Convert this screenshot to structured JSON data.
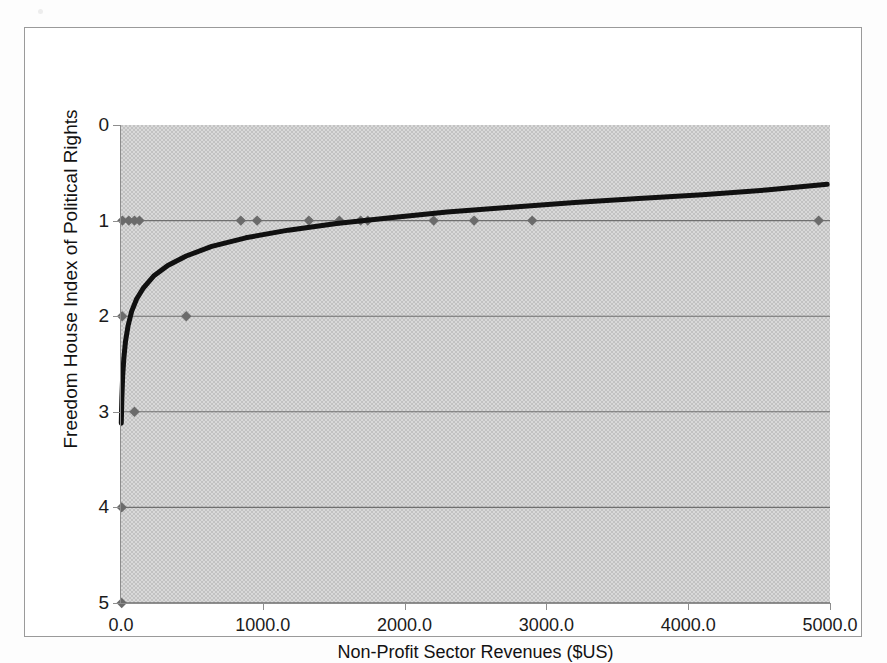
{
  "chart_data": {
    "type": "scatter",
    "title": "",
    "xlabel": "Non-Profit Sector Revenues ($US)",
    "ylabel": "Freedom House Index of Political Rights",
    "xlim": [
      0,
      5000
    ],
    "ylim": [
      0,
      5
    ],
    "y_inverted": true,
    "grid": "horizontal",
    "legend": "none",
    "xticks": [
      "0.0",
      "1000.0",
      "2000.0",
      "3000.0",
      "4000.0",
      "5000.0"
    ],
    "xtick_values": [
      0,
      1000,
      2000,
      3000,
      4000,
      5000
    ],
    "yticks": [
      "0",
      "1",
      "2",
      "3",
      "4",
      "5"
    ],
    "ytick_values": [
      0,
      1,
      2,
      3,
      4,
      5
    ],
    "series": [
      {
        "name": "Countries",
        "type": "scatter",
        "marker": "diamond",
        "color": "#6b6b6b",
        "points": [
          {
            "x": 10,
            "y": 1
          },
          {
            "x": 55,
            "y": 1
          },
          {
            "x": 95,
            "y": 1
          },
          {
            "x": 130,
            "y": 1
          },
          {
            "x": 845,
            "y": 1
          },
          {
            "x": 960,
            "y": 1
          },
          {
            "x": 1325,
            "y": 1
          },
          {
            "x": 1540,
            "y": 1
          },
          {
            "x": 1690,
            "y": 1
          },
          {
            "x": 1740,
            "y": 1
          },
          {
            "x": 2205,
            "y": 1
          },
          {
            "x": 2490,
            "y": 1
          },
          {
            "x": 2900,
            "y": 1
          },
          {
            "x": 4920,
            "y": 1
          },
          {
            "x": 8,
            "y": 2
          },
          {
            "x": 460,
            "y": 2
          },
          {
            "x": 95,
            "y": 3
          },
          {
            "x": 5,
            "y": 4
          },
          {
            "x": 5,
            "y": 5
          }
        ]
      },
      {
        "name": "Logarithmic trend",
        "type": "line",
        "color": "#101010",
        "width": 5,
        "description": "Logarithmic fit rising from about 3.1 at x=0 toward 0.62 at x=5000",
        "points": [
          {
            "x": 2,
            "y": 3.12
          },
          {
            "x": 6,
            "y": 2.86
          },
          {
            "x": 12,
            "y": 2.62
          },
          {
            "x": 20,
            "y": 2.44
          },
          {
            "x": 32,
            "y": 2.26
          },
          {
            "x": 50,
            "y": 2.1
          },
          {
            "x": 75,
            "y": 1.95
          },
          {
            "x": 110,
            "y": 1.82
          },
          {
            "x": 160,
            "y": 1.7
          },
          {
            "x": 230,
            "y": 1.58
          },
          {
            "x": 330,
            "y": 1.47
          },
          {
            "x": 460,
            "y": 1.37
          },
          {
            "x": 640,
            "y": 1.27
          },
          {
            "x": 880,
            "y": 1.18
          },
          {
            "x": 1180,
            "y": 1.1
          },
          {
            "x": 1520,
            "y": 1.03
          },
          {
            "x": 1900,
            "y": 0.97
          },
          {
            "x": 2300,
            "y": 0.91
          },
          {
            "x": 2750,
            "y": 0.86
          },
          {
            "x": 3200,
            "y": 0.81
          },
          {
            "x": 3650,
            "y": 0.77
          },
          {
            "x": 4100,
            "y": 0.73
          },
          {
            "x": 4550,
            "y": 0.68
          },
          {
            "x": 4980,
            "y": 0.62
          }
        ]
      }
    ],
    "colors": {
      "plot_background": "#c2c2c2",
      "gridline": "#6f6f6f",
      "axis": "#8e8e8e",
      "marker": "#6b6b6b",
      "trendline": "#101010",
      "text": "#1b1b1b",
      "frame": "#9a9a9a"
    }
  }
}
